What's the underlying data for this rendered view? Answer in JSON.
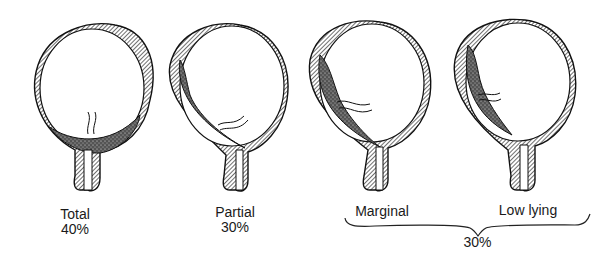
{
  "figures": [
    {
      "id": "total",
      "label": "Total",
      "percent": "40%"
    },
    {
      "id": "partial",
      "label": "Partial",
      "percent": "30%"
    },
    {
      "id": "marginal",
      "label": "Marginal"
    },
    {
      "id": "low-lying",
      "label": "Low lying"
    }
  ],
  "group": {
    "members": [
      "Marginal",
      "Low lying"
    ],
    "percent": "30%"
  },
  "colors": {
    "ink": "#1a1a1a",
    "background": "#ffffff"
  }
}
